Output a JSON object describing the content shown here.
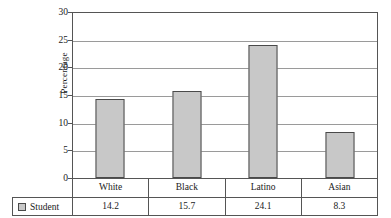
{
  "chart_data": {
    "type": "bar",
    "title": "",
    "xlabel": "",
    "ylabel": "Percentage",
    "categories": [
      "White",
      "Black",
      "Latino",
      "Asian"
    ],
    "series": [
      {
        "name": "Student",
        "values": [
          14.2,
          15.7,
          24.1,
          8.3
        ]
      }
    ],
    "values": [
      14.2,
      15.7,
      24.1,
      8.3
    ],
    "ylim": [
      0,
      30
    ],
    "yticks": [
      0,
      5,
      10,
      15,
      20,
      25,
      30
    ],
    "ytick_labels": [
      "0",
      "5",
      "10",
      "15",
      "20",
      "25",
      "30"
    ],
    "grid": true,
    "legend_position": "bottom-table",
    "bar_fill_color": "#c8c8c8",
    "bar_edge_color": "#4a4a4a",
    "gridline_color": "#9a9a9a",
    "axis_color": "#555555",
    "data_table": {
      "row_label": "Student",
      "columns": [
        "White",
        "Black",
        "Latino",
        "Asian"
      ],
      "values": [
        "14.2",
        "15.7",
        "24.1",
        "8.3"
      ]
    }
  }
}
